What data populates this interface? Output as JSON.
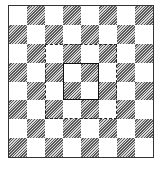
{
  "diagram": {
    "type": "checkerboard",
    "rows": 8,
    "cols": 8,
    "top_left_cell": "light",
    "cell_styles": {
      "light": "plain-white",
      "dark": "diagonal-hatched"
    },
    "colors": {
      "frame": "#333333",
      "light_cell": "#ffffff",
      "hatch_line": "#5a5a5a",
      "hatch_bg": "#d8d8d8",
      "dashed_outline": "#222222",
      "solid_outline": "#111111"
    },
    "overlays": [
      {
        "name": "dashed-square",
        "style": "dashed",
        "row_start": 2,
        "row_end": 5,
        "col_start": 2,
        "col_end": 5,
        "description": "central 4x4 region"
      },
      {
        "name": "solid-square",
        "style": "solid",
        "row_start": 3,
        "row_end": 4,
        "col_start": 3,
        "col_end": 4,
        "description": "central 2x2 region"
      }
    ]
  }
}
